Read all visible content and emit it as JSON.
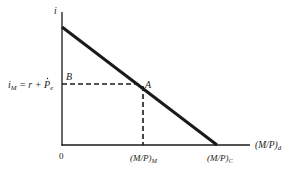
{
  "diagram": {
    "type": "money-demand",
    "colors": {
      "ink": "#1a1a1a",
      "background": "#ffffff"
    },
    "y_axis": {
      "label": "i"
    },
    "x_axis": {
      "label_main": "(M/P)",
      "label_sub": "d"
    },
    "origin_label": "0",
    "y_marker": {
      "label_main": "i",
      "label_sub": "M",
      "label_rest": " = r + ",
      "label_pe": "P",
      "label_pe_sub": "e"
    },
    "points": [
      {
        "id": "A",
        "label": "A"
      },
      {
        "id": "B",
        "label": "B"
      }
    ],
    "x_markers": [
      {
        "id": "M",
        "label_main": "(M/P)",
        "label_sub": "M"
      },
      {
        "id": "C",
        "label_main": "(M/P)",
        "label_sub": "C"
      }
    ]
  }
}
